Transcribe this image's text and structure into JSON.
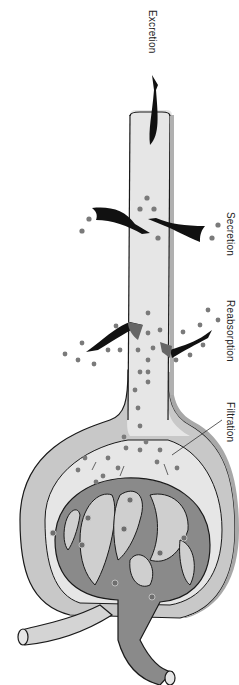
{
  "diagram": {
    "type": "nephron-glomerulus-processes",
    "orientation": "rotated-90-clockwise",
    "labels": {
      "excretion": "Excretion",
      "secretion": "Secretion",
      "reabsorption": "Reabsorption",
      "filtration": "Filtration"
    },
    "colors": {
      "tubule_fill": "#e6e6e6",
      "capsule_fill": "#c8c8c8",
      "capsule_edge": "#a8a8a8",
      "vessel_fill": "#8a8a8a",
      "afferent_fill": "#d4d4d4",
      "arrow": "#111111",
      "arrow_gray": "#777777",
      "dot": "#7a7a7a",
      "outline": "#1a1a1a"
    }
  }
}
